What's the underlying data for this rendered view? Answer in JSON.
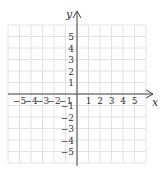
{
  "diagram": {
    "type": "coordinate-plane",
    "x_axis_label": "x",
    "y_axis_label": "y",
    "x_range": [
      -6,
      6
    ],
    "y_range": [
      -6,
      6
    ],
    "x_tick_labels": [
      "−5",
      "−4",
      "−3",
      "−2",
      "−1",
      "1",
      "2",
      "3",
      "4",
      "5"
    ],
    "y_tick_labels": [
      "5",
      "4",
      "3",
      "2",
      "1",
      "−1",
      "−2",
      "−3",
      "−4",
      "−5"
    ],
    "grid": true,
    "colors": {
      "grid": "#e2e2e2",
      "axis": "#444444",
      "text": "#333333"
    }
  }
}
